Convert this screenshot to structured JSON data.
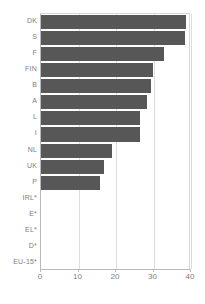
{
  "chart_data": {
    "type": "bar",
    "orientation": "horizontal",
    "title": "",
    "subtitle": "",
    "xlabel": "",
    "ylabel": "",
    "xlim": [
      0,
      40
    ],
    "xticks": [
      0,
      10,
      20,
      30,
      40
    ],
    "xtick_labels": [
      "0",
      "10",
      "20",
      "30",
      "40"
    ],
    "grid": "vertical",
    "legend": "none",
    "bar_color": "#575757",
    "axis_color": "#b9b9b9",
    "gridline_color": "#dcdcdc",
    "label_color": "#7d7d7d",
    "categories": [
      "DK",
      "S",
      "F",
      "FIN",
      "B",
      "A",
      "L",
      "I",
      "NL",
      "UK",
      "P",
      "IRL*",
      "E*",
      "EL*",
      "D*",
      "EU-15*"
    ],
    "values": [
      38.7,
      38.4,
      32.8,
      29.9,
      29.3,
      28.3,
      26.4,
      26.4,
      18.9,
      16.8,
      15.7,
      0,
      0,
      0,
      0,
      0
    ]
  }
}
